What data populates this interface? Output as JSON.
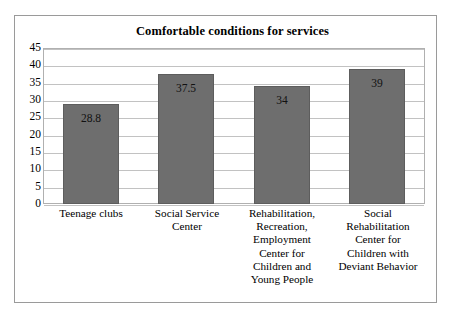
{
  "chart_data": {
    "type": "bar",
    "title": "Comfortable conditions for services",
    "xlabel": "",
    "ylabel": "",
    "ylim": [
      0,
      45
    ],
    "yticks": [
      45,
      40,
      35,
      30,
      25,
      20,
      15,
      10,
      5,
      0
    ],
    "grid": true,
    "legend": false,
    "bar_color": "#6e6e6e",
    "categories": [
      "Teenage clubs",
      "Social Service Center",
      "Rehabilitation, Recreation, Employment Center  for Children and Young People",
      "Social Rehabilitation Center for Children with Deviant Behavior"
    ],
    "category_lines": [
      [
        "Teenage clubs"
      ],
      [
        "Social Service",
        "Center"
      ],
      [
        "Rehabilitation,",
        "Recreation,",
        "Employment",
        "Center  for",
        "Children and",
        "Young People"
      ],
      [
        "Social",
        "Rehabilitation",
        "Center for",
        "Children with",
        "Deviant Behavior"
      ]
    ],
    "values": [
      28.8,
      37.5,
      34,
      39
    ],
    "value_labels": [
      "28.8",
      "37.5",
      "34",
      "39"
    ]
  }
}
